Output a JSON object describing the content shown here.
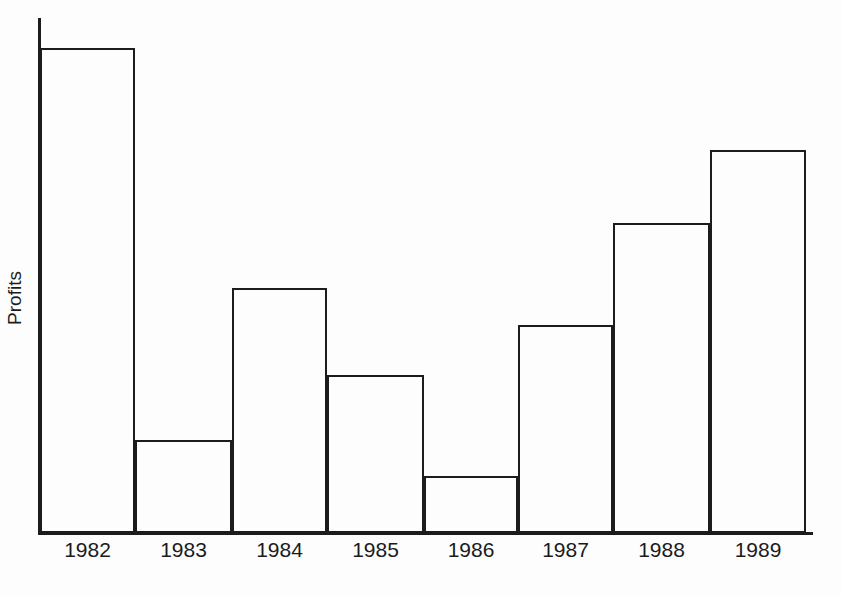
{
  "chart_data": {
    "type": "bar",
    "title": "Profits growing up",
    "xlabel": "",
    "ylabel": "Profits",
    "categories": [
      "1982",
      "1983",
      "1984",
      "1985",
      "1986",
      "1987",
      "1988",
      "1989"
    ],
    "values": [
      485,
      93,
      245,
      158,
      57,
      208,
      310,
      383
    ],
    "value_unit": "relative bar height (px above baseline; axis unlabeled)",
    "ylim": [
      0,
      517
    ],
    "grid": false,
    "legend": null,
    "annotations": [],
    "bar_style": {
      "fill": "none",
      "outline_color": "#1c1c1c",
      "outline_width_px": 2,
      "gap_px": 0
    },
    "axis_style": {
      "line_color": "#1c1c1c",
      "y_axis_ticks": [],
      "x_axis_ticks": [
        "1982",
        "1983",
        "1984",
        "1985",
        "1986",
        "1987",
        "1988",
        "1989"
      ],
      "top_spine": false,
      "right_spine": false
    }
  },
  "figure": {
    "background_color": "#fdfdfd",
    "ink_color": "#1c1c1c",
    "title_visible": false,
    "bars": [
      {
        "category": "1982",
        "value": 485,
        "left": 2,
        "width": 95
      },
      {
        "category": "1983",
        "value": 93,
        "left": 97,
        "width": 97
      },
      {
        "category": "1984",
        "value": 245,
        "left": 194,
        "width": 95
      },
      {
        "category": "1985",
        "value": 158,
        "left": 289,
        "width": 97
      },
      {
        "category": "1986",
        "value": 57,
        "left": 386,
        "width": 94
      },
      {
        "category": "1987",
        "value": 208,
        "left": 480,
        "width": 95
      },
      {
        "category": "1988",
        "value": 310,
        "left": 575,
        "width": 97
      },
      {
        "category": "1989",
        "value": 383,
        "left": 672,
        "width": 96
      }
    ],
    "tick_label_positions": [
      {
        "label": "1982",
        "left": 2,
        "width": 95
      },
      {
        "label": "1983",
        "left": 97,
        "width": 97
      },
      {
        "label": "1984",
        "left": 194,
        "width": 95
      },
      {
        "label": "1985",
        "left": 289,
        "width": 97
      },
      {
        "label": "1986",
        "left": 386,
        "width": 94
      },
      {
        "label": "1987",
        "left": 480,
        "width": 95
      },
      {
        "label": "1988",
        "left": 575,
        "width": 97
      },
      {
        "label": "1989",
        "left": 672,
        "width": 96
      }
    ]
  }
}
